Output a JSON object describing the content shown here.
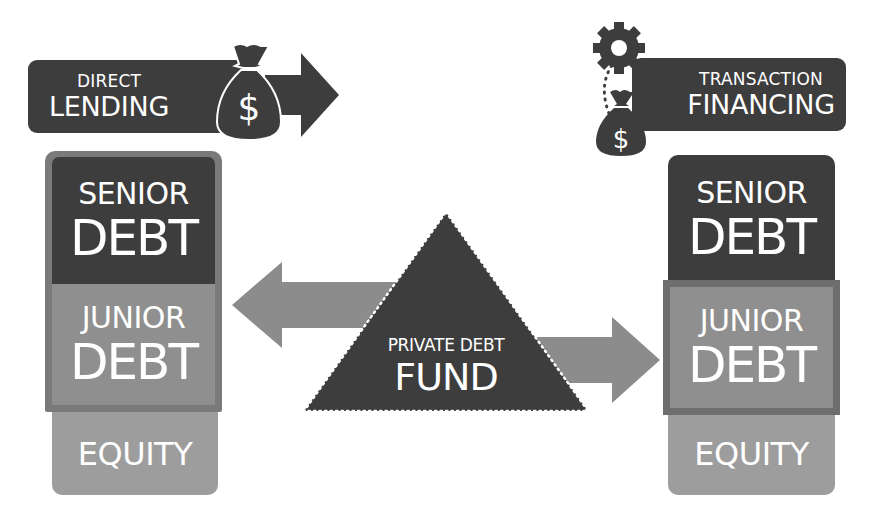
{
  "diagram": {
    "colors": {
      "dark": "#3d3d3d",
      "medium": "#8a8a8a",
      "junior_fill": "#8f8f8f",
      "frame": "#6e6e6e",
      "equity": "#9d9d9d",
      "arrow": "#8c8c8c",
      "text": "#ffffff"
    },
    "left": {
      "header": {
        "line1": "DIRECT",
        "line2": "LENDING",
        "icon": "money-bag-icon",
        "arrow": "right-arrow"
      },
      "stack": [
        {
          "line1": "SENIOR",
          "line2": "DEBT"
        },
        {
          "line1": "JUNIOR",
          "line2": "DEBT"
        },
        {
          "line1": "EQUITY"
        }
      ],
      "highlight": "senior-and-junior"
    },
    "right": {
      "header": {
        "line1": "TRANSACTION",
        "line2": "FINANCING",
        "icon": "gear-and-money-bag-icon"
      },
      "stack": [
        {
          "line1": "SENIOR",
          "line2": "DEBT"
        },
        {
          "line1": "JUNIOR",
          "line2": "DEBT"
        },
        {
          "line1": "EQUITY"
        }
      ],
      "highlight": "junior"
    },
    "center": {
      "line1": "PRIVATE DEBT",
      "line2": "FUND",
      "arrows": [
        "left-to-direct-lending",
        "right-to-transaction-financing"
      ]
    }
  }
}
